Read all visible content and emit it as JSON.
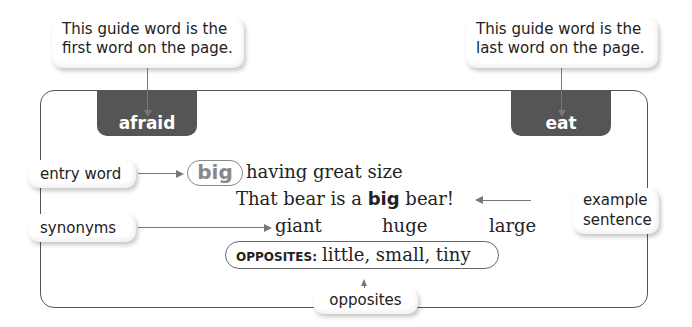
{
  "callouts": {
    "first_guide": [
      "This guide word is the",
      "first word on the page."
    ],
    "last_guide": [
      "This guide word is the",
      "last word on the page."
    ],
    "entry_word": "entry word",
    "synonyms": "synonyms",
    "example_sentence": [
      "example",
      "sentence"
    ],
    "opposites": "opposites"
  },
  "guide_words": {
    "first": "afraid",
    "last": "eat"
  },
  "entry": {
    "word": "big",
    "definition": "having great size",
    "example_before": "That bear is a ",
    "example_bold": "big",
    "example_after": " bear!",
    "synonyms": [
      "giant",
      "huge",
      "large"
    ],
    "opposites_label": "OPPOSITES:",
    "opposites": "little, small, tiny"
  },
  "colors": {
    "tab_fill": "#555555",
    "entry_word_gray": "#888888",
    "line": "#777777"
  }
}
